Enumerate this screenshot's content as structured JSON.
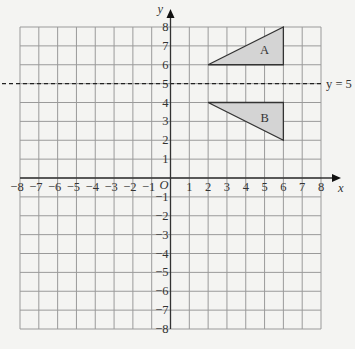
{
  "diagram": {
    "type": "coordinate-grid",
    "x_axis": {
      "label": "x",
      "min": -8,
      "max": 8,
      "ticks": [
        "-8",
        "-7",
        "-6",
        "-5",
        "-4",
        "-3",
        "-2",
        "-1",
        "1",
        "2",
        "3",
        "4",
        "5",
        "6",
        "7",
        "8"
      ]
    },
    "y_axis": {
      "label": "y",
      "min": -8,
      "max": 8,
      "ticks": [
        "8",
        "7",
        "6",
        "5",
        "4",
        "3",
        "2",
        "1",
        "-1",
        "-2",
        "-3",
        "-4",
        "-5",
        "-6",
        "-7",
        "-8"
      ]
    },
    "origin_label": "O",
    "mirror_line": {
      "label": "y = 5",
      "y": 5,
      "style": "dashed"
    },
    "shapes": [
      {
        "name": "A",
        "label": "A",
        "vertices": [
          [
            2,
            6
          ],
          [
            6,
            6
          ],
          [
            6,
            8
          ]
        ],
        "fill": "#d4d4d4"
      },
      {
        "name": "B",
        "label": "B",
        "vertices": [
          [
            2,
            4
          ],
          [
            6,
            4
          ],
          [
            6,
            2
          ]
        ],
        "fill": "#d4d4d4"
      }
    ],
    "colors": {
      "grid": "#9a9a9a",
      "axis": "#333333",
      "background": "#f4f4f2"
    }
  }
}
